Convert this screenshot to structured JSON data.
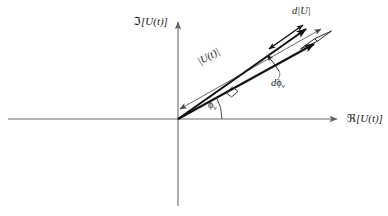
{
  "figure": {
    "kind": "phasor-diagram",
    "background_color": "#ffffff",
    "axis_color": "#6b6b6b",
    "vector_color": "#111111",
    "thin_arrow_color": "#555555",
    "text_color": "#1a1a1a"
  },
  "axes": {
    "imaginary": {
      "label_prefix": "ℑ",
      "label_body": "[U(t)]",
      "label": "ℑ[U(t)]",
      "orientation": "vertical",
      "arrow": "up"
    },
    "real": {
      "label_prefix": "ℜ",
      "label_body": "[U(t)]",
      "label": "ℜ [U(t)]",
      "orientation": "horizontal",
      "arrow": "right"
    },
    "origin": {
      "x": 178,
      "y": 119
    }
  },
  "annotations": {
    "magnitude": {
      "label": "|U(t)|",
      "description": "double-headed thin arrow measuring the phasor length"
    },
    "amplitude_differential": {
      "label_d": "d",
      "label_mag": "|U|",
      "label": "d|U|",
      "description": "small double-headed arrow showing change in magnitude"
    },
    "phase_differential": {
      "label_d": "d",
      "label_phi": "ϕ",
      "label_sub": "v",
      "label": "dϕ",
      "description": "arc between the two phasor arrows showing change in phase"
    },
    "phase_angle": {
      "label_phi": "ϕ",
      "label_sub": "v",
      "label": "ϕ",
      "description": "angle between the real axis and the phasor"
    }
  },
  "geometry": {
    "phasor_angle_deg": 29,
    "phasor_delta_angle_deg": 6,
    "phasor_length_px": 155
  }
}
